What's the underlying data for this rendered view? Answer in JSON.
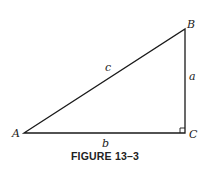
{
  "figure": {
    "caption": "FIGURE 13–3",
    "vertices": {
      "A": {
        "label": "A",
        "x": 24,
        "y": 133
      },
      "B": {
        "label": "B",
        "x": 185,
        "y": 29
      },
      "C": {
        "label": "C",
        "x": 185,
        "y": 133
      }
    },
    "sides": {
      "a": {
        "label": "a",
        "between": [
          "B",
          "C"
        ]
      },
      "b": {
        "label": "b",
        "between": [
          "A",
          "C"
        ]
      },
      "c": {
        "label": "c",
        "between": [
          "A",
          "B"
        ]
      }
    },
    "right_angle_at": "C",
    "line_color": "#1a1a1a"
  }
}
